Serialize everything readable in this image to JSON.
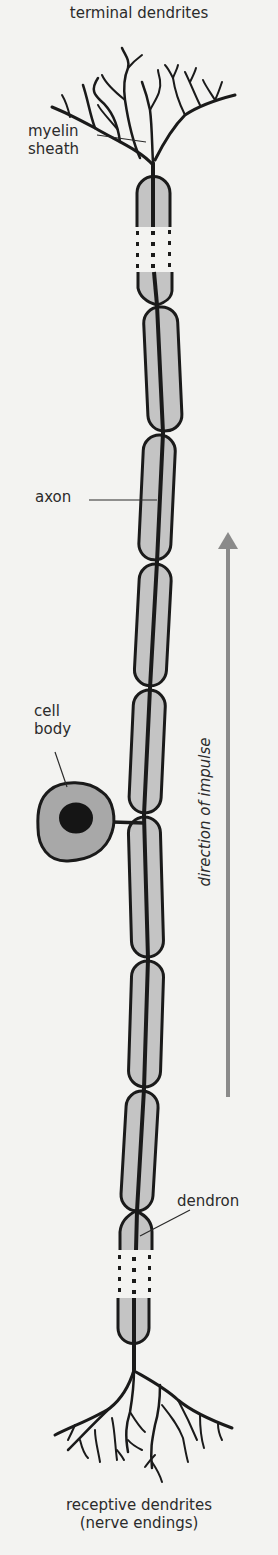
{
  "diagram": {
    "labels": {
      "terminal_dendrites": "terminal dendrites",
      "myelin_line1": "myelin",
      "myelin_line2": "sheath",
      "axon": "axon",
      "cell_line1": "cell",
      "cell_line2": "body",
      "direction": "direction of impulse",
      "dendron": "dendron",
      "receptive_line1": "receptive dendrites",
      "receptive_line2": "(nerve endings)"
    },
    "colors": {
      "background": "#f3f3f1",
      "myelin_fill": "#c4c4c4",
      "cell_fill": "#a8a8a8",
      "outline": "#1a1a1a",
      "arrow": "#8a8a8a"
    },
    "nodes_of_ranvier_y": [
      305,
      433,
      562,
      688,
      815,
      959,
      1089,
      1211
    ],
    "impulse_direction": "up"
  }
}
